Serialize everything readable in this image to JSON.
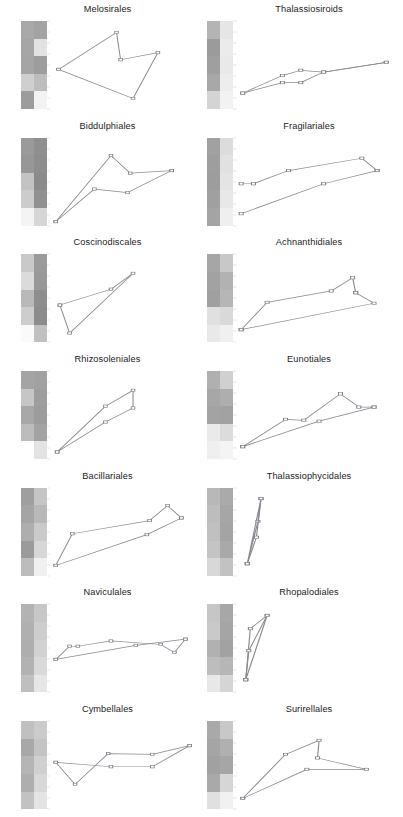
{
  "figure": {
    "type": "small-multiples",
    "columns": 2,
    "rows": 7,
    "background": "#ffffff",
    "line_color": "#8a8a92",
    "marker_fill": "#ffffff",
    "tick_color": "#d8d8dc",
    "title_color": "#1c1c1c"
  },
  "chart_data": {
    "type": "line",
    "title": "",
    "xlabel": "",
    "ylabel": "",
    "grid": false,
    "legend": "none",
    "panels": [
      {
        "index": 0,
        "title": "Melosirales",
        "column": "left",
        "row": 1,
        "heatmap": {
          "columns": 2,
          "rows": 5,
          "values": [
            [
              "#a9a9a9",
              "#a3a3a3"
            ],
            [
              "#a6a6a6",
              "#e2e2e2"
            ],
            [
              "#a5a5a5",
              "#9d9d9d"
            ],
            [
              "#cfcfcf",
              "#bdbdbd"
            ],
            [
              "#9c9c9c",
              "#f2f2f2"
            ]
          ]
        },
        "series": [
          {
            "name": "series-a",
            "x": [
              0.04,
              0.46,
              0.49,
              0.76,
              0.58,
              0.04
            ],
            "y": [
              0.55,
              0.13,
              0.44,
              0.36,
              0.88,
              0.55
            ]
          }
        ]
      },
      {
        "index": 1,
        "title": "Thalassiosiroids",
        "column": "right",
        "row": 1,
        "heatmap": {
          "columns": 2,
          "rows": 5,
          "values": [
            [
              "#b4b4b4",
              "#e6e6e6"
            ],
            [
              "#9b9b9b",
              "#ebebeb"
            ],
            [
              "#9f9f9f",
              "#e9e9e9"
            ],
            [
              "#a8a8a8",
              "#ededed"
            ],
            [
              "#d4d4d4",
              "#f2f2f2"
            ]
          ]
        },
        "series": [
          {
            "name": "series-a",
            "x": [
              0.02,
              0.28,
              0.4,
              0.55,
              0.96
            ],
            "y": [
              0.82,
              0.62,
              0.56,
              0.58,
              0.47
            ]
          },
          {
            "name": "series-b",
            "x": [
              0.02,
              0.28,
              0.4,
              0.55,
              0.96
            ],
            "y": [
              0.82,
              0.7,
              0.7,
              0.58,
              0.47
            ]
          }
        ]
      },
      {
        "index": 2,
        "title": "Biddulphiales",
        "column": "left",
        "row": 2,
        "heatmap": {
          "columns": 2,
          "rows": 5,
          "values": [
            [
              "#9a9a9a",
              "#8f8f8f"
            ],
            [
              "#979797",
              "#8d8d8d"
            ],
            [
              "#c3c3c3",
              "#8b8b8b"
            ],
            [
              "#cccccc",
              "#919191"
            ],
            [
              "#f4f4f4",
              "#d6d6d6"
            ]
          ]
        },
        "series": [
          {
            "name": "series-a",
            "x": [
              0.02,
              0.42,
              0.56,
              0.86
            ],
            "y": [
              0.95,
              0.2,
              0.4,
              0.37
            ]
          },
          {
            "name": "series-b",
            "x": [
              0.02,
              0.3,
              0.54,
              0.86
            ],
            "y": [
              0.95,
              0.58,
              0.62,
              0.37
            ]
          }
        ]
      },
      {
        "index": 3,
        "title": "Fragilariales",
        "column": "right",
        "row": 2,
        "heatmap": {
          "columns": 2,
          "rows": 5,
          "values": [
            [
              "#a1a1a1",
              "#dcdcdc"
            ],
            [
              "#9e9e9e",
              "#e1e1e1"
            ],
            [
              "#9d9d9d",
              "#e4e4e4"
            ],
            [
              "#a0a0a0",
              "#e8e8e8"
            ],
            [
              "#a4a4a4",
              "#efefef"
            ]
          ]
        },
        "series": [
          {
            "name": "series-a",
            "x": [
              0.01,
              0.09,
              0.32,
              0.8,
              0.9
            ],
            "y": [
              0.52,
              0.52,
              0.37,
              0.23,
              0.37
            ]
          },
          {
            "name": "series-b",
            "x": [
              0.01,
              0.55,
              0.9
            ],
            "y": [
              0.86,
              0.52,
              0.37
            ]
          }
        ]
      },
      {
        "index": 4,
        "title": "Coscinodiscales",
        "column": "left",
        "row": 3,
        "heatmap": {
          "columns": 2,
          "rows": 5,
          "values": [
            [
              "#c9c9c9",
              "#9a9a9a"
            ],
            [
              "#dbdbdb",
              "#989898"
            ],
            [
              "#b9b9b9",
              "#8e8e8e"
            ],
            [
              "#cdcdcd",
              "#8c8c8c"
            ],
            [
              "#fafafa",
              "#c0c0c0"
            ]
          ]
        },
        "series": [
          {
            "name": "series-a",
            "x": [
              0.05,
              0.42,
              0.58,
              0.12,
              0.05
            ],
            "y": [
              0.58,
              0.4,
              0.22,
              0.9,
              0.58
            ]
          }
        ]
      },
      {
        "index": 5,
        "title": "Achnanthidiales",
        "column": "right",
        "row": 3,
        "heatmap": {
          "columns": 2,
          "rows": 5,
          "values": [
            [
              "#a6a6a6",
              "#c8c8c8"
            ],
            [
              "#a2a2a2",
              "#b2b2b2"
            ],
            [
              "#a0a0a0",
              "#b6b6b6"
            ],
            [
              "#e0e0e0",
              "#d9d9d9"
            ],
            [
              "#e9e9e9",
              "#f0f0f0"
            ]
          ]
        },
        "series": [
          {
            "name": "series-a",
            "x": [
              0.01,
              0.18,
              0.6,
              0.74,
              0.76
            ],
            "y": [
              0.86,
              0.55,
              0.42,
              0.27,
              0.44
            ]
          },
          {
            "name": "series-b",
            "x": [
              0.01,
              0.88,
              0.76
            ],
            "y": [
              0.86,
              0.56,
              0.44
            ]
          }
        ]
      },
      {
        "index": 6,
        "title": "Rhizosoleniales",
        "column": "left",
        "row": 4,
        "heatmap": {
          "columns": 2,
          "rows": 5,
          "values": [
            [
              "#a4a4a4",
              "#a1a1a1"
            ],
            [
              "#c6c6c6",
              "#9e9e9e"
            ],
            [
              "#a8a8a8",
              "#9c9c9c"
            ],
            [
              "#bcbcbc",
              "#a3a3a3"
            ],
            [
              "#ffffff",
              "#e3e3e3"
            ]
          ]
        },
        "series": [
          {
            "name": "series-a",
            "x": [
              0.03,
              0.38,
              0.58,
              0.58,
              0.38,
              0.03
            ],
            "y": [
              0.92,
              0.4,
              0.22,
              0.42,
              0.58,
              0.92
            ]
          }
        ]
      },
      {
        "index": 7,
        "title": "Eunotiales",
        "column": "right",
        "row": 4,
        "heatmap": {
          "columns": 2,
          "rows": 5,
          "values": [
            [
              "#b0b0b0",
              "#d0d0d0"
            ],
            [
              "#a7a7a7",
              "#aeaeae"
            ],
            [
              "#a3a3a3",
              "#a2a2a2"
            ],
            [
              "#eaeaea",
              "#dcdcdc"
            ],
            [
              "#efefef",
              "#f4f4f4"
            ]
          ]
        },
        "series": [
          {
            "name": "series-a",
            "x": [
              0.02,
              0.3,
              0.42,
              0.66,
              0.78,
              0.88
            ],
            "y": [
              0.86,
              0.55,
              0.56,
              0.26,
              0.41,
              0.41
            ]
          },
          {
            "name": "series-b",
            "x": [
              0.02,
              0.52,
              0.88
            ],
            "y": [
              0.86,
              0.57,
              0.41
            ]
          }
        ]
      },
      {
        "index": 8,
        "title": "Bacillariales",
        "column": "left",
        "row": 5,
        "heatmap": {
          "columns": 2,
          "rows": 5,
          "values": [
            [
              "#9f9f9f",
              "#c5c5c5"
            ],
            [
              "#a5a5a5",
              "#b8b8b8"
            ],
            [
              "#aeaeae",
              "#cacaca"
            ],
            [
              "#9b9b9b",
              "#d7d7d7"
            ],
            [
              "#bcbcbc",
              "#f0f0f0"
            ]
          ]
        },
        "series": [
          {
            "name": "series-a",
            "x": [
              0.02,
              0.14,
              0.7,
              0.83,
              0.93
            ],
            "y": [
              0.88,
              0.52,
              0.37,
              0.2,
              0.34
            ]
          },
          {
            "name": "series-b",
            "x": [
              0.02,
              0.68,
              0.93
            ],
            "y": [
              0.88,
              0.53,
              0.34
            ]
          }
        ]
      },
      {
        "index": 9,
        "title": "Thalassiophycidales",
        "column": "right",
        "row": 5,
        "heatmap": {
          "columns": 2,
          "rows": 5,
          "values": [
            [
              "#b8b8b8",
              "#aaaaaa"
            ],
            [
              "#bdbdbd",
              "#a6a6a6"
            ],
            [
              "#c0c0c0",
              "#a4a4a4"
            ],
            [
              "#c4c4c4",
              "#a9a9a9"
            ],
            [
              "#d8d8d8",
              "#c2c2c2"
            ]
          ]
        },
        "series": [
          {
            "name": "series-a",
            "x": [
              0.05,
              0.14,
              0.12,
              0.05
            ],
            "y": [
              0.86,
              0.12,
              0.38,
              0.86
            ]
          },
          {
            "name": "series-b",
            "x": [
              0.05,
              0.11,
              0.14
            ],
            "y": [
              0.86,
              0.56,
              0.12
            ]
          }
        ]
      },
      {
        "index": 10,
        "title": "Naviculales",
        "column": "left",
        "row": 6,
        "heatmap": {
          "columns": 2,
          "rows": 5,
          "values": [
            [
              "#b3b3b3",
              "#c7c7c7"
            ],
            [
              "#b0b0b0",
              "#cdcdcd"
            ],
            [
              "#aeaeae",
              "#d2d2d2"
            ],
            [
              "#b2b2b2",
              "#d9d9d9"
            ],
            [
              "#bfbfbf",
              "#e6e6e6"
            ]
          ]
        },
        "series": [
          {
            "name": "series-a",
            "x": [
              0.02,
              0.12,
              0.18,
              0.42,
              0.78,
              0.88,
              0.96
            ],
            "y": [
              0.63,
              0.48,
              0.48,
              0.42,
              0.46,
              0.55,
              0.4
            ]
          },
          {
            "name": "series-b",
            "x": [
              0.02,
              0.6,
              0.96
            ],
            "y": [
              0.63,
              0.47,
              0.4
            ]
          }
        ]
      },
      {
        "index": 11,
        "title": "Rhopalodiales",
        "column": "right",
        "row": 6,
        "heatmap": {
          "columns": 2,
          "rows": 5,
          "values": [
            [
              "#c6c6c6",
              "#a7a7a7"
            ],
            [
              "#c9c9c9",
              "#a5a5a5"
            ],
            [
              "#b1b1b1",
              "#a2a2a2"
            ],
            [
              "#bdbdbd",
              "#b6b6b6"
            ],
            [
              "#e8e8e8",
              "#d5d5d5"
            ]
          ]
        },
        "series": [
          {
            "name": "series-a",
            "x": [
              0.04,
              0.07,
              0.18,
              0.04
            ],
            "y": [
              0.86,
              0.28,
              0.13,
              0.86
            ]
          },
          {
            "name": "series-b",
            "x": [
              0.04,
              0.06,
              0.18
            ],
            "y": [
              0.86,
              0.53,
              0.13
            ]
          }
        ]
      },
      {
        "index": 12,
        "title": "Cymbellales",
        "column": "left",
        "row": 7,
        "heatmap": {
          "columns": 2,
          "rows": 5,
          "values": [
            [
              "#c0c0c0",
              "#cbcbcb"
            ],
            [
              "#a8a8a8",
              "#c4c4c4"
            ],
            [
              "#b5b5b5",
              "#d0d0d0"
            ],
            [
              "#aeaeae",
              "#d8d8d8"
            ],
            [
              "#c2c2c2",
              "#e4e4e4"
            ]
          ]
        },
        "series": [
          {
            "name": "series-a",
            "x": [
              0.02,
              0.16,
              0.4,
              0.72,
              0.99
            ],
            "y": [
              0.47,
              0.72,
              0.37,
              0.38,
              0.28
            ]
          },
          {
            "name": "series-b",
            "x": [
              0.02,
              0.42,
              0.72,
              0.99
            ],
            "y": [
              0.47,
              0.52,
              0.52,
              0.28
            ]
          }
        ]
      },
      {
        "index": 13,
        "title": "Surirellales",
        "column": "right",
        "row": 7,
        "heatmap": {
          "columns": 2,
          "rows": 5,
          "values": [
            [
              "#a9a9a9",
              "#c8c8c8"
            ],
            [
              "#a5a5a5",
              "#b0b0b0"
            ],
            [
              "#a1a1a1",
              "#a6a6a6"
            ],
            [
              "#a9a9a9",
              "#d6d6d6"
            ],
            [
              "#e0e0e0",
              "#f1f1f1"
            ]
          ]
        },
        "series": [
          {
            "name": "series-a",
            "x": [
              0.02,
              0.3,
              0.52,
              0.51,
              0.83,
              0.44,
              0.02
            ],
            "y": [
              0.88,
              0.38,
              0.22,
              0.42,
              0.55,
              0.55,
              0.88
            ]
          }
        ]
      }
    ]
  }
}
